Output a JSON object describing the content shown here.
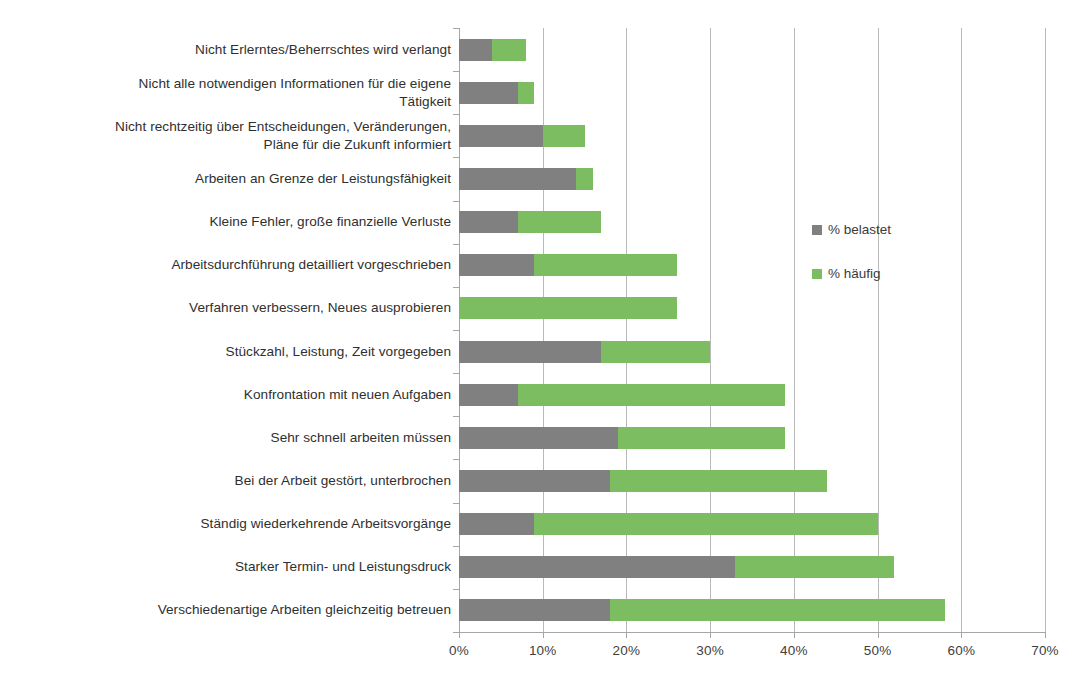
{
  "chart_data": {
    "type": "bar",
    "orientation": "horizontal",
    "stacked": false,
    "title": "",
    "subtitle": "",
    "xlabel": "",
    "ylabel": "",
    "xlim": [
      0,
      70
    ],
    "xtick_step": 10,
    "xticks": [
      "0%",
      "10%",
      "20%",
      "30%",
      "40%",
      "50%",
      "60%",
      "70%"
    ],
    "grid": "vertical",
    "legend_position": "right-middle",
    "legend": [
      "% belastet",
      "% häufig"
    ],
    "colors": {
      "belastet": "#808080",
      "haeufig": "#7dbd62"
    },
    "categories": [
      "Nicht Erlerntes/Beherrschtes wird verlangt",
      "Nicht alle notwendigen Informationen für die eigene Tätigkeit",
      "Nicht rechtzeitig über Entscheidungen, Veränderungen, Pläne für die Zukunft informiert",
      "Arbeiten an Grenze der Leistungsfähigkeit",
      "Kleine Fehler, große finanzielle Verluste",
      "Arbeitsdurchführung detailliert vorgeschrieben",
      "Verfahren verbessern, Neues ausprobieren",
      "Stückzahl, Leistung, Zeit vorgegeben",
      "Konfrontation mit neuen Aufgaben",
      "Sehr schnell arbeiten müssen",
      "Bei der Arbeit gestört, unterbrochen",
      "Ständig wiederkehrende Arbeitsvorgänge",
      "Starker Termin- und Leistungsdruck",
      "Verschiedenartige Arbeiten gleichzeitig betreuen"
    ],
    "series": [
      {
        "name": "% belastet",
        "color": "#808080",
        "values": [
          4,
          7,
          10,
          14,
          7,
          9,
          0,
          17,
          7,
          19,
          18,
          9,
          33,
          18
        ]
      },
      {
        "name": "% häufig",
        "color": "#7dbd62",
        "values": [
          8,
          9,
          15,
          16,
          17,
          26,
          26,
          30,
          39,
          39,
          44,
          50,
          52,
          58
        ]
      }
    ]
  },
  "legend": {
    "items": [
      {
        "label": "% belastet",
        "color": "#808080"
      },
      {
        "label": "% häufig",
        "color": "#7dbd62"
      }
    ]
  }
}
